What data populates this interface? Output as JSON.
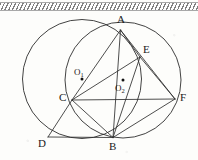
{
  "figure": {
    "kind": "plane-geometry-diagram",
    "width": 198,
    "height": 160,
    "background_color": "#fdfdfb",
    "ink_color": "#2e2e2e",
    "label_color": "#1a1a1a"
  },
  "decorations": {
    "top_band": {
      "name": "hatched-edge-band",
      "style": "diagonal-hatch",
      "color": "#6b6b6b"
    }
  },
  "points": [
    {
      "id": "A",
      "label": "A",
      "x": 120.5,
      "y": 30.0,
      "label_x": 117.0,
      "label_y": 14.0
    },
    {
      "id": "E",
      "label": "E",
      "x": 140.0,
      "y": 57.0,
      "label_x": 143.0,
      "label_y": 44.0
    },
    {
      "id": "F",
      "label": "F",
      "x": 175.0,
      "y": 99.0,
      "label_x": 180.0,
      "label_y": 92.0
    },
    {
      "id": "C",
      "label": "C",
      "x": 72.0,
      "y": 100.0,
      "label_x": 59.0,
      "label_y": 92.0
    },
    {
      "id": "B",
      "label": "B",
      "x": 113.0,
      "y": 137.5,
      "label_x": 109.0,
      "label_y": 141.0
    },
    {
      "id": "D",
      "label": "D",
      "x": 48.0,
      "y": 137.0,
      "label_x": 38.0,
      "label_y": 138.0
    }
  ],
  "centers": [
    {
      "id": "O1",
      "label": "O",
      "sub": "1",
      "dot_x": 82.0,
      "dot_y": 79.0,
      "label_x": 74.0,
      "label_y": 68.0
    },
    {
      "id": "O2",
      "label": "O",
      "sub": "2",
      "dot_x": 123.0,
      "dot_y": 80.0,
      "label_x": 115.0,
      "label_y": 84.0
    }
  ],
  "circles": [
    {
      "id": "circle-O1",
      "name": "left-large-circle",
      "cx": 82.0,
      "cy": 79.0,
      "r": 59.5
    },
    {
      "id": "circle-O2",
      "name": "right-small-circle",
      "cx": 123.0,
      "cy": 80.0,
      "r": 58.0
    }
  ],
  "segments": [
    {
      "id": "A-C",
      "from": "A",
      "to": "C",
      "name": "chord-AC"
    },
    {
      "id": "A-E",
      "from": "A",
      "to": "E",
      "name": "chord-AE"
    },
    {
      "id": "A-B",
      "from": "A",
      "to": "B",
      "name": "chord-AB"
    },
    {
      "id": "A-F",
      "from": "A",
      "to": "F",
      "name": "chord-AF"
    },
    {
      "id": "E-C",
      "from": "E",
      "to": "C",
      "name": "chord-EC"
    },
    {
      "id": "E-B",
      "from": "E",
      "to": "B",
      "name": "chord-EB"
    },
    {
      "id": "E-F",
      "from": "E",
      "to": "F",
      "name": "chord-EF"
    },
    {
      "id": "C-F",
      "from": "C",
      "to": "F",
      "name": "chord-CF"
    },
    {
      "id": "C-B",
      "from": "C",
      "to": "B",
      "name": "chord-CB"
    },
    {
      "id": "C-D",
      "from": "C",
      "to": "D",
      "name": "chord-CD"
    },
    {
      "id": "D-B",
      "from": "D",
      "to": "B",
      "name": "chord-DB"
    },
    {
      "id": "B-F",
      "from": "B",
      "to": "F",
      "name": "chord-BF"
    }
  ]
}
